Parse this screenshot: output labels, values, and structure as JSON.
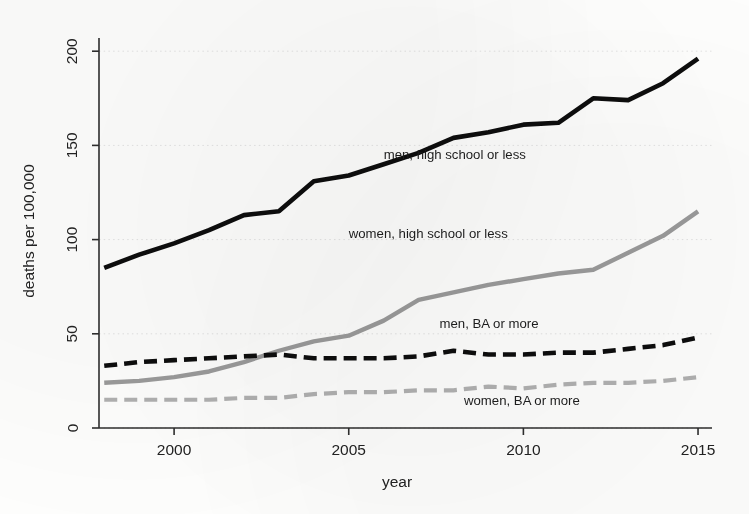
{
  "chart_data": {
    "type": "line",
    "title": "",
    "subtitle": "",
    "xlabel": "year",
    "ylabel": "deaths per 100,000",
    "xlim": [
      1997.85,
      2015.4
    ],
    "ylim": [
      0,
      207
    ],
    "xticks": [
      2000,
      2005,
      2010,
      2015
    ],
    "xticklabels": [
      "2000",
      "2005",
      "2010",
      "2015"
    ],
    "yticks": [
      0,
      50,
      100,
      150,
      200
    ],
    "yticklabels": [
      "0",
      "50",
      "100",
      "150",
      "200"
    ],
    "grid": true,
    "grid_axis": "y",
    "legend_position": "inline-annotations",
    "x": [
      1998,
      1999,
      2000,
      2001,
      2002,
      2003,
      2004,
      2005,
      2006,
      2007,
      2008,
      2009,
      2010,
      2011,
      2012,
      2013,
      2014,
      2015
    ],
    "series": [
      {
        "name": "men, high school or less",
        "style": "solid",
        "color": "#0d0d0d",
        "width": 4.6,
        "values": [
          85,
          92,
          98,
          105,
          113,
          115,
          131,
          134,
          140,
          146,
          154,
          157,
          161,
          162,
          175,
          174,
          183,
          196
        ],
        "label": "men, high school or less",
        "label_x": 2006.0,
        "label_y": 143
      },
      {
        "name": "women, high school or less",
        "style": "solid",
        "color": "#9a9a9a",
        "width": 4.4,
        "values": [
          24,
          25,
          27,
          30,
          35,
          41,
          46,
          49,
          57,
          68,
          72,
          76,
          79,
          82,
          84,
          93,
          102,
          115
        ],
        "label": "women, high school or less",
        "label_x": 2005.0,
        "label_y": 101
      },
      {
        "name": "men, BA or more",
        "style": "dashed",
        "color": "#0d0d0d",
        "width": 4.6,
        "values": [
          33,
          35,
          36,
          37,
          38,
          39,
          37,
          37,
          37,
          38,
          41,
          39,
          39,
          40,
          40,
          42,
          44,
          48
        ],
        "label": "men, BA or more",
        "label_x": 2007.6,
        "label_y": 53
      },
      {
        "name": "women, BA or more",
        "style": "dashed",
        "color": "#b0b0b0",
        "width": 4.2,
        "values": [
          15,
          15,
          15,
          15,
          16,
          16,
          18,
          19,
          19,
          20,
          20,
          22,
          21,
          23,
          24,
          24,
          25,
          27
        ],
        "label": "women, BA or more",
        "label_x": 2008.3,
        "label_y": 12
      }
    ]
  },
  "axes": {
    "y_axis_title": "deaths per 100,000",
    "x_axis_title": "year"
  }
}
